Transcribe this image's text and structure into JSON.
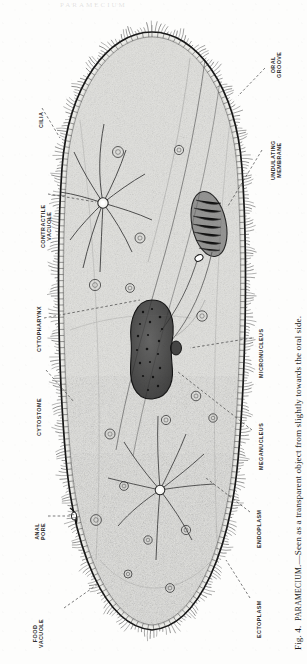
{
  "page": {
    "running_head": "PARAMECIUM",
    "background_color": "#fdfdfc",
    "ink_color": "#2b2b2b"
  },
  "figure": {
    "number": "Fig. 4.",
    "subject": "PARAMECIUM.",
    "caption_body": "—Seen as a transparent object from slightly towards the oral side.",
    "caption_full": "Fig. 4.  PARAMECIUM.—Seen as a transparent object from slightly towards the oral side.",
    "orientation": "rotated-90-ccw",
    "organism": "Paramecium",
    "view": "transparent object, slightly towards the oral side"
  },
  "labels": [
    {
      "id": "oral-groove",
      "text_lines": [
        "ORAL",
        "GROOVE"
      ]
    },
    {
      "id": "undulating-membrane",
      "text_lines": [
        "UNDULATING",
        "MEMBRANE"
      ]
    },
    {
      "id": "cilia",
      "text_lines": [
        "CILIA"
      ]
    },
    {
      "id": "contractile-vacuole",
      "text_lines": [
        "CONTRACTILE",
        "VACUOLE"
      ]
    },
    {
      "id": "cytopharynx",
      "text_lines": [
        "CYTOPHARYNX"
      ]
    },
    {
      "id": "cytostome",
      "text_lines": [
        "CYTOSTOME"
      ]
    },
    {
      "id": "anal-pore",
      "text_lines": [
        "ANAL",
        "PORE"
      ]
    },
    {
      "id": "food-vacuole",
      "text_lines": [
        "FOOD",
        "VACUOLE"
      ]
    },
    {
      "id": "ectoplasm",
      "text_lines": [
        "ECTOPLASM"
      ]
    },
    {
      "id": "endoplasm",
      "text_lines": [
        "ENDOPLASM"
      ]
    },
    {
      "id": "meganucleus",
      "text_lines": [
        "MEGANUCLEUS"
      ]
    },
    {
      "id": "micronucleus",
      "text_lines": [
        "MICRONUCLEUS"
      ]
    }
  ],
  "label_text": {
    "oral_groove_1": "ORAL",
    "oral_groove_2": "GROOVE",
    "undulating_1": "UNDULATING",
    "undulating_2": "MEMBRANE",
    "cilia": "CILIA",
    "contractile_1": "CONTRACTILE",
    "contractile_2": "VACUOLE",
    "cytopharynx": "CYTOPHARYNX",
    "cytostome": "CYTOSTOME",
    "anal_1": "ANAL",
    "anal_2": "PORE",
    "food_1": "FOOD",
    "food_2": "VACUOLE",
    "ectoplasm": "ECTOPLASM",
    "endoplasm": "ENDOPLASM",
    "meganucleus": "MEGANUCLEUS",
    "micronucleus": "MICRONUCLEUS"
  },
  "caption_parts": {
    "fig_no": "Fig. 4.",
    "name": "PARAMECIUM",
    "rest": ".—Seen as a transparent object from slightly towards the oral side."
  }
}
